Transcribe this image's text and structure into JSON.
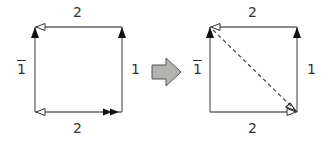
{
  "diagram": {
    "type": "edge-identification transformation",
    "colors": {
      "line": "#666666",
      "arrow_fill": "#111111",
      "transform_arrow": "#b3b3b0",
      "transform_arrow_stroke": "#555555"
    },
    "left_square": {
      "labels": {
        "top": "2",
        "bottom": "2",
        "left": "1",
        "left_bar": true,
        "right": "1"
      }
    },
    "transform_arrow": {
      "icon": "right-block-arrow"
    },
    "right_square": {
      "labels": {
        "top": "2",
        "bottom": "2",
        "left": "1",
        "left_bar": true,
        "right": "1"
      },
      "diagonal": {
        "style": "dashed",
        "direction": "top-left to bottom-right"
      }
    }
  }
}
